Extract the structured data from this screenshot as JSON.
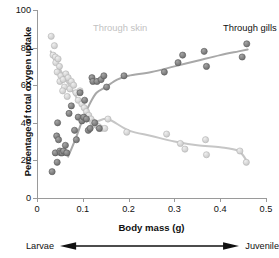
{
  "chart_data": {
    "type": "scatter",
    "title": "",
    "xlabel": "Body mass (g)",
    "ylabel": "Percentage of total oxygen uptake",
    "xlim": [
      0,
      0.5
    ],
    "ylim": [
      0,
      100
    ],
    "xticks": [
      "0",
      "0.1",
      "0.2",
      "0.3",
      "0.4",
      "0.5"
    ],
    "xtick_values": [
      0,
      0.1,
      0.2,
      0.3,
      0.4,
      0.5
    ],
    "yticks": [
      "0",
      "20",
      "40",
      "60",
      "80",
      "100"
    ],
    "ytick_values": [
      0,
      20,
      40,
      60,
      80,
      100
    ],
    "grid": false,
    "legend_position": "inside-top",
    "annotations": {
      "stage_left": "Larvae",
      "stage_right": "Juvenile",
      "stage_arrow": "double-headed-arrow"
    },
    "series": [
      {
        "name": "Through skin",
        "color": "#c6c6c6",
        "marker": "circle",
        "points": [
          [
            0.031,
            86
          ],
          [
            0.038,
            81
          ],
          [
            0.035,
            76
          ],
          [
            0.04,
            75
          ],
          [
            0.041,
            72
          ],
          [
            0.046,
            74
          ],
          [
            0.049,
            70
          ],
          [
            0.044,
            67
          ],
          [
            0.052,
            65
          ],
          [
            0.05,
            62
          ],
          [
            0.057,
            63
          ],
          [
            0.06,
            59
          ],
          [
            0.056,
            57
          ],
          [
            0.063,
            66
          ],
          [
            0.068,
            64
          ],
          [
            0.072,
            58
          ],
          [
            0.066,
            54
          ],
          [
            0.075,
            62
          ],
          [
            0.08,
            60
          ],
          [
            0.085,
            56
          ],
          [
            0.09,
            52
          ],
          [
            0.094,
            57
          ],
          [
            0.098,
            50
          ],
          [
            0.103,
            48
          ],
          [
            0.108,
            46
          ],
          [
            0.113,
            44
          ],
          [
            0.118,
            42
          ],
          [
            0.122,
            40
          ],
          [
            0.128,
            39
          ],
          [
            0.134,
            38
          ],
          [
            0.14,
            37
          ],
          [
            0.148,
            37
          ],
          [
            0.155,
            42
          ],
          [
            0.196,
            35
          ],
          [
            0.283,
            34
          ],
          [
            0.313,
            29
          ],
          [
            0.323,
            26
          ],
          [
            0.368,
            31
          ],
          [
            0.37,
            23
          ],
          [
            0.443,
            25
          ],
          [
            0.457,
            19
          ]
        ],
        "trend": "decreasing"
      },
      {
        "name": "Through gills",
        "color": "#6b6b6b",
        "marker": "circle",
        "points": [
          [
            0.033,
            14
          ],
          [
            0.04,
            24
          ],
          [
            0.043,
            33
          ],
          [
            0.045,
            40
          ],
          [
            0.047,
            31
          ],
          [
            0.044,
            19
          ],
          [
            0.05,
            25
          ],
          [
            0.052,
            24
          ],
          [
            0.055,
            24
          ],
          [
            0.058,
            25
          ],
          [
            0.062,
            28
          ],
          [
            0.065,
            24
          ],
          [
            0.07,
            45
          ],
          [
            0.075,
            49
          ],
          [
            0.082,
            36
          ],
          [
            0.086,
            31
          ],
          [
            0.09,
            43
          ],
          [
            0.094,
            56
          ],
          [
            0.098,
            41
          ],
          [
            0.102,
            43
          ],
          [
            0.104,
            52
          ],
          [
            0.108,
            42
          ],
          [
            0.112,
            36
          ],
          [
            0.116,
            37
          ],
          [
            0.12,
            64
          ],
          [
            0.122,
            62
          ],
          [
            0.126,
            40
          ],
          [
            0.131,
            62
          ],
          [
            0.136,
            37
          ],
          [
            0.14,
            63
          ],
          [
            0.146,
            65
          ],
          [
            0.152,
            59
          ],
          [
            0.19,
            65
          ],
          [
            0.278,
            67
          ],
          [
            0.308,
            72
          ],
          [
            0.318,
            76
          ],
          [
            0.365,
            78
          ],
          [
            0.37,
            70
          ],
          [
            0.448,
            75
          ],
          [
            0.458,
            82
          ]
        ],
        "trend": "increasing"
      }
    ],
    "fit_curves": [
      {
        "series": "Through skin",
        "color": "#c6c6c6",
        "path_points": [
          [
            0.03,
            78
          ],
          [
            0.045,
            71
          ],
          [
            0.06,
            64
          ],
          [
            0.075,
            58
          ],
          [
            0.09,
            52
          ],
          [
            0.11,
            45
          ],
          [
            0.13,
            41
          ],
          [
            0.155,
            42
          ],
          [
            0.2,
            36
          ],
          [
            0.25,
            33
          ],
          [
            0.3,
            30
          ],
          [
            0.35,
            28
          ],
          [
            0.4,
            27
          ],
          [
            0.44,
            25
          ],
          [
            0.46,
            19
          ]
        ]
      },
      {
        "series": "Through gills",
        "color": "#a8a8a8",
        "path_points": [
          [
            0.068,
            22
          ],
          [
            0.085,
            32
          ],
          [
            0.1,
            42
          ],
          [
            0.115,
            50
          ],
          [
            0.13,
            56
          ],
          [
            0.15,
            59
          ],
          [
            0.175,
            63
          ],
          [
            0.2,
            65
          ],
          [
            0.25,
            67
          ],
          [
            0.3,
            70
          ],
          [
            0.35,
            73
          ],
          [
            0.4,
            76
          ],
          [
            0.44,
            78
          ],
          [
            0.46,
            79
          ]
        ]
      }
    ]
  }
}
